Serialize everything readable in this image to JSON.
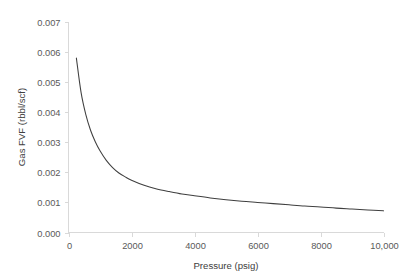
{
  "chart_data": {
    "type": "line",
    "title": "",
    "subtitle": "",
    "xlabel": "Pressure (psig)",
    "ylabel": "Gas FVF (rbbl/scf)",
    "xlim": [
      0,
      10000
    ],
    "ylim": [
      0,
      0.007
    ],
    "grid": false,
    "legend": null,
    "legend_position": "none",
    "xticks": [
      0,
      2000,
      4000,
      6000,
      8000,
      10000
    ],
    "xticklabels": [
      "0",
      "2000",
      "4000",
      "6000",
      "8000",
      "10,000"
    ],
    "yticks": [
      0.0,
      0.001,
      0.002,
      0.003,
      0.004,
      0.005,
      0.006,
      0.007
    ],
    "yticklabels": [
      "0.000",
      "0.001",
      "0.002",
      "0.003",
      "0.004",
      "0.005",
      "0.006",
      "0.007"
    ],
    "series": [
      {
        "name": "Gas FVF",
        "color": "#3f3f3f",
        "x": [
          250,
          400,
          550,
          700,
          850,
          1000,
          1200,
          1400,
          1600,
          1800,
          2000,
          2400,
          2800,
          3200,
          3600,
          4000,
          4500,
          5000,
          5500,
          6000,
          6500,
          7000,
          7500,
          8000,
          8500,
          9000,
          9500,
          10000
        ],
        "y": [
          0.0058,
          0.00465,
          0.00392,
          0.0034,
          0.00302,
          0.00272,
          0.0024,
          0.00216,
          0.00198,
          0.00185,
          0.00174,
          0.00157,
          0.00145,
          0.00136,
          0.00128,
          0.00122,
          0.00115,
          0.00109,
          0.00104,
          0.001,
          0.00096,
          0.00092,
          0.00088,
          0.00085,
          0.00081,
          0.00078,
          0.00075,
          0.00072
        ]
      }
    ]
  },
  "axes": {
    "x_title": "Pressure (psig)",
    "y_title": "Gas FVF (rbbl/scf)"
  },
  "colors": {
    "series": "#3f3f3f",
    "axis": "#d9d9d9",
    "text": "#595959",
    "background": "#ffffff"
  }
}
